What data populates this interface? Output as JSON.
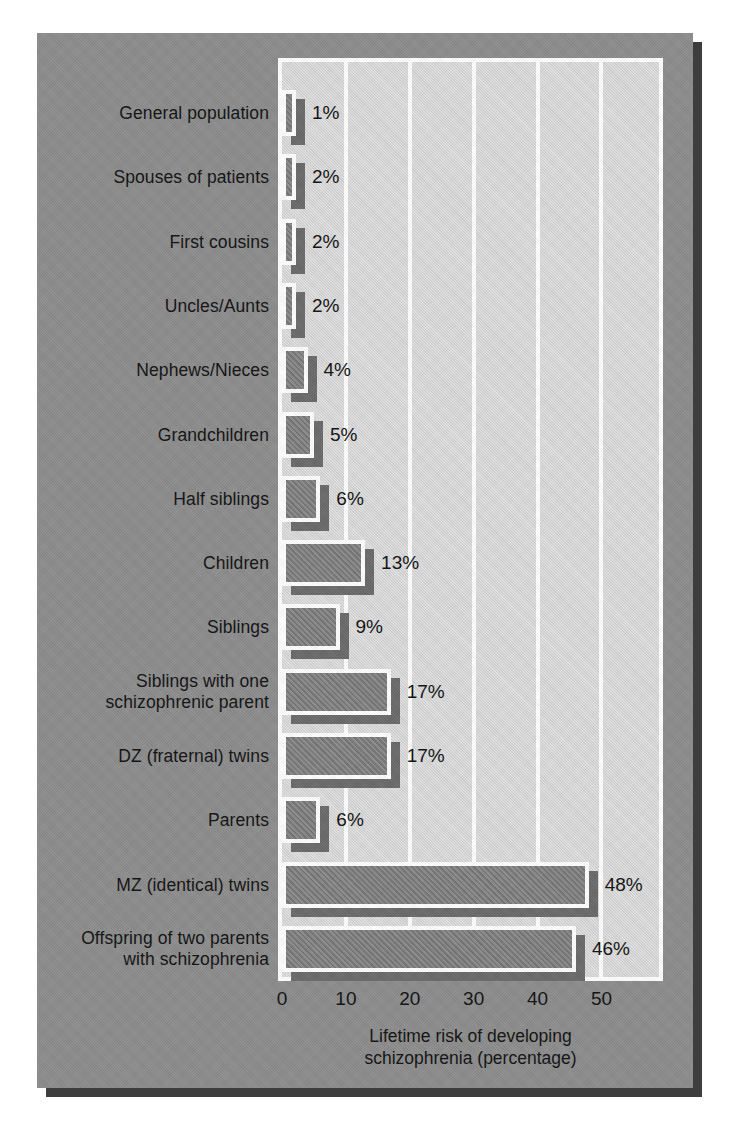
{
  "chart_data": {
    "type": "bar",
    "orientation": "horizontal",
    "title": "",
    "xlabel": "Lifetime risk of developing\nschizophrenia (percentage)",
    "ylabel": "",
    "xlim": [
      0,
      59
    ],
    "xticks": [
      0,
      10,
      20,
      30,
      40,
      50
    ],
    "xtick_labels": [
      "0",
      "10",
      "20",
      "30",
      "40",
      "50"
    ],
    "grid": true,
    "legend": "none",
    "categories": [
      "General population",
      "Spouses of patients",
      "First cousins",
      "Uncles/Aunts",
      "Nephews/Nieces",
      "Grandchildren",
      "Half siblings",
      "Children",
      "Siblings",
      "Siblings with one\nschizophrenic parent",
      "DZ (fraternal) twins",
      "Parents",
      "MZ (identical) twins",
      "Offspring of two parents\nwith schizophrenia"
    ],
    "values": [
      1,
      2,
      2,
      2,
      4,
      5,
      6,
      13,
      9,
      17,
      17,
      6,
      48,
      46
    ],
    "value_labels": [
      "1%",
      "2%",
      "2%",
      "2%",
      "4%",
      "5%",
      "6%",
      "13%",
      "9%",
      "17%",
      "17%",
      "6%",
      "48%",
      "46%"
    ]
  },
  "style": {
    "panel_background": "#8d8d8d",
    "plot_background": "#d9d9d9",
    "bar_fill": "#7f7f7f",
    "bar_outline": "#ffffff",
    "bar_shadow": "#6b6b6b",
    "panel_shadow": "#3d3d3d",
    "text_color": "#111111",
    "gridline_color": "#ffffff"
  }
}
